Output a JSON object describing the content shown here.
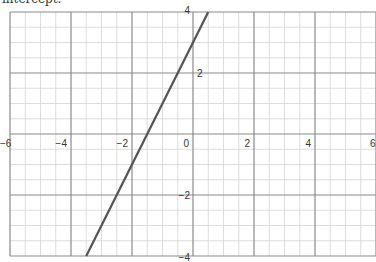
{
  "caption": "intercept.",
  "chart_data": {
    "type": "line",
    "title": "",
    "xlabel": "",
    "ylabel": "",
    "xlim": [
      -6,
      6
    ],
    "ylim": [
      -4,
      4
    ],
    "grid": true,
    "minor_grid_step": 0.5,
    "major_grid_step": 2,
    "x_ticks": [
      -6,
      -4,
      -2,
      0,
      2,
      4,
      6
    ],
    "y_ticks": [
      -4,
      -2,
      2,
      4
    ],
    "x_tick_labels": [
      "−6",
      "−4",
      "−2",
      "0",
      "2",
      "4",
      "6"
    ],
    "y_tick_labels": [
      "−4",
      "−2",
      "2",
      "4"
    ],
    "series": [
      {
        "name": "y = 2x + 3",
        "x": [
          -3.5,
          0.5
        ],
        "y": [
          -4,
          4
        ],
        "color": "#555555"
      }
    ]
  },
  "colors": {
    "minor_grid": "#d4d4d4",
    "major_grid": "#8a8a8a",
    "line": "#555555"
  }
}
